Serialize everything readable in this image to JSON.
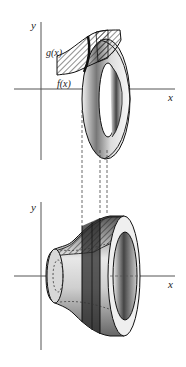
{
  "figure": {
    "top_panel": {
      "axis_labels": {
        "x": "x",
        "y": "y"
      },
      "curve_labels": {
        "upper": "g(x)",
        "lower": "f(x)"
      }
    },
    "bottom_panel": {
      "axis_labels": {
        "x": "x",
        "y": "y"
      }
    },
    "colors": {
      "ink": "#1a1a1a",
      "axis": "#555555",
      "background": "#ffffff"
    }
  }
}
